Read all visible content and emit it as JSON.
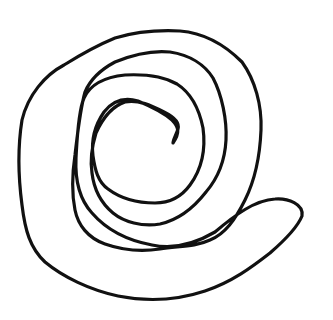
{
  "figure": {
    "background_color": "#ffffff",
    "stroke_color": "#111111",
    "stroke_width": 3.2
  },
  "shapes": [
    {
      "name": "spiral-outline",
      "d": "M 173,143 C 180,133 179,127 172,120 C 163,112 150,106 138,101 C 121,96 111,103 104,112 C 95,125 91,140 93,156 C 95,170 98,182 108,189 C 120,198 135,203 155,203 C 172,203 182,196 190,185 C 201,170 206,150 203,128 C 199,108 191,93 177,84 C 163,76 145,74 125,75 C 105,77 90,85 84,98 C 78,112 77,140 76,158 C 75,180 80,200 92,213 C 105,228 125,240 152,245 C 175,250 198,242 215,232 C 235,215 255,200 275,199 C 288,198 304,204 302,216 C 298,226 285,240 270,253 C 252,267 232,282 205,291 C 178,300 148,302 118,296 C 90,290 63,277 45,262 C 30,248 25,230 22,205 C 18,175 18,145 22,120 C 28,95 45,75 64,65 C 80,55 98,45 115,38 C 135,32 160,30 180,31 C 205,33 225,45 242,62 C 255,80 262,105 261,130 C 260,155 255,180 245,200 C 235,220 225,234 210,240 C 195,247 180,246 160,249 C 140,252 122,250 105,244 C 88,238 78,225 75,210 C 72,195 72,175 75,155 C 78,130 80,110 85,92 C 90,80 100,70 115,62 C 132,55 150,50 170,52 C 190,55 205,65 213,78 C 222,95 227,120 226,140 C 225,160 218,178 206,192 C 192,210 178,220 160,224 C 142,227 124,222 113,213 C 101,203 94,190 92,173 C 90,160 92,146 96,133 C 102,120 110,107 125,102 C 138,99 152,106 164,112 C 174,117 180,122 178,129 C 176,135 173,140 173,143 Z"
    }
  ]
}
